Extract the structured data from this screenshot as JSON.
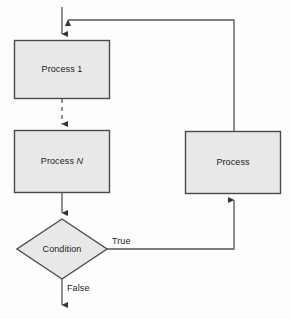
{
  "diagram": {
    "type": "flowchart",
    "colors": {
      "shape_fill": "#e8e8e8",
      "shape_stroke": "#4a4a4a",
      "connector": "#555555",
      "text": "#1b1b1b",
      "background": "#fdfdfd"
    },
    "nodes": [
      {
        "id": "process-1",
        "kind": "process",
        "label": "Process 1",
        "x": 14,
        "y": 40,
        "width": 96,
        "height": 59
      },
      {
        "id": "process-n",
        "kind": "process",
        "label_prefix": "Process ",
        "label_variable": "N",
        "label": "Process N",
        "x": 14,
        "y": 130,
        "width": 96,
        "height": 63
      },
      {
        "id": "condition",
        "kind": "decision",
        "label": "Condition",
        "cx": 62,
        "cy": 249,
        "half_width": 45,
        "half_height": 30
      },
      {
        "id": "process-right",
        "kind": "process",
        "label": "Process",
        "x": 185,
        "y": 131,
        "width": 96,
        "height": 63
      }
    ],
    "edges": [
      {
        "id": "entry-to-process-1",
        "label": "",
        "from": "entry",
        "to": "process-1",
        "style": "solid",
        "arrow": "down"
      },
      {
        "id": "process-1-to-process-n",
        "label": "",
        "from": "process-1",
        "to": "process-n",
        "style": "dashed",
        "arrow": "down"
      },
      {
        "id": "process-n-to-condition",
        "label": "",
        "from": "process-n",
        "to": "condition",
        "style": "solid",
        "arrow": "down"
      },
      {
        "id": "condition-true-to-process-right",
        "label": "True",
        "from": "condition",
        "to": "process-right",
        "style": "solid",
        "arrow": "up"
      },
      {
        "id": "process-right-to-entry",
        "label": "",
        "from": "process-right",
        "to": "entry",
        "style": "solid",
        "arrow": "left"
      },
      {
        "id": "condition-false-exit",
        "label": "False",
        "from": "condition",
        "to": "exit",
        "style": "solid",
        "arrow": "down"
      }
    ],
    "labels": {
      "process_1": "Process 1",
      "process_n_prefix": "Process ",
      "process_n_variable": "N",
      "condition": "Condition",
      "process_right": "Process",
      "true": "True",
      "false": "False"
    }
  }
}
